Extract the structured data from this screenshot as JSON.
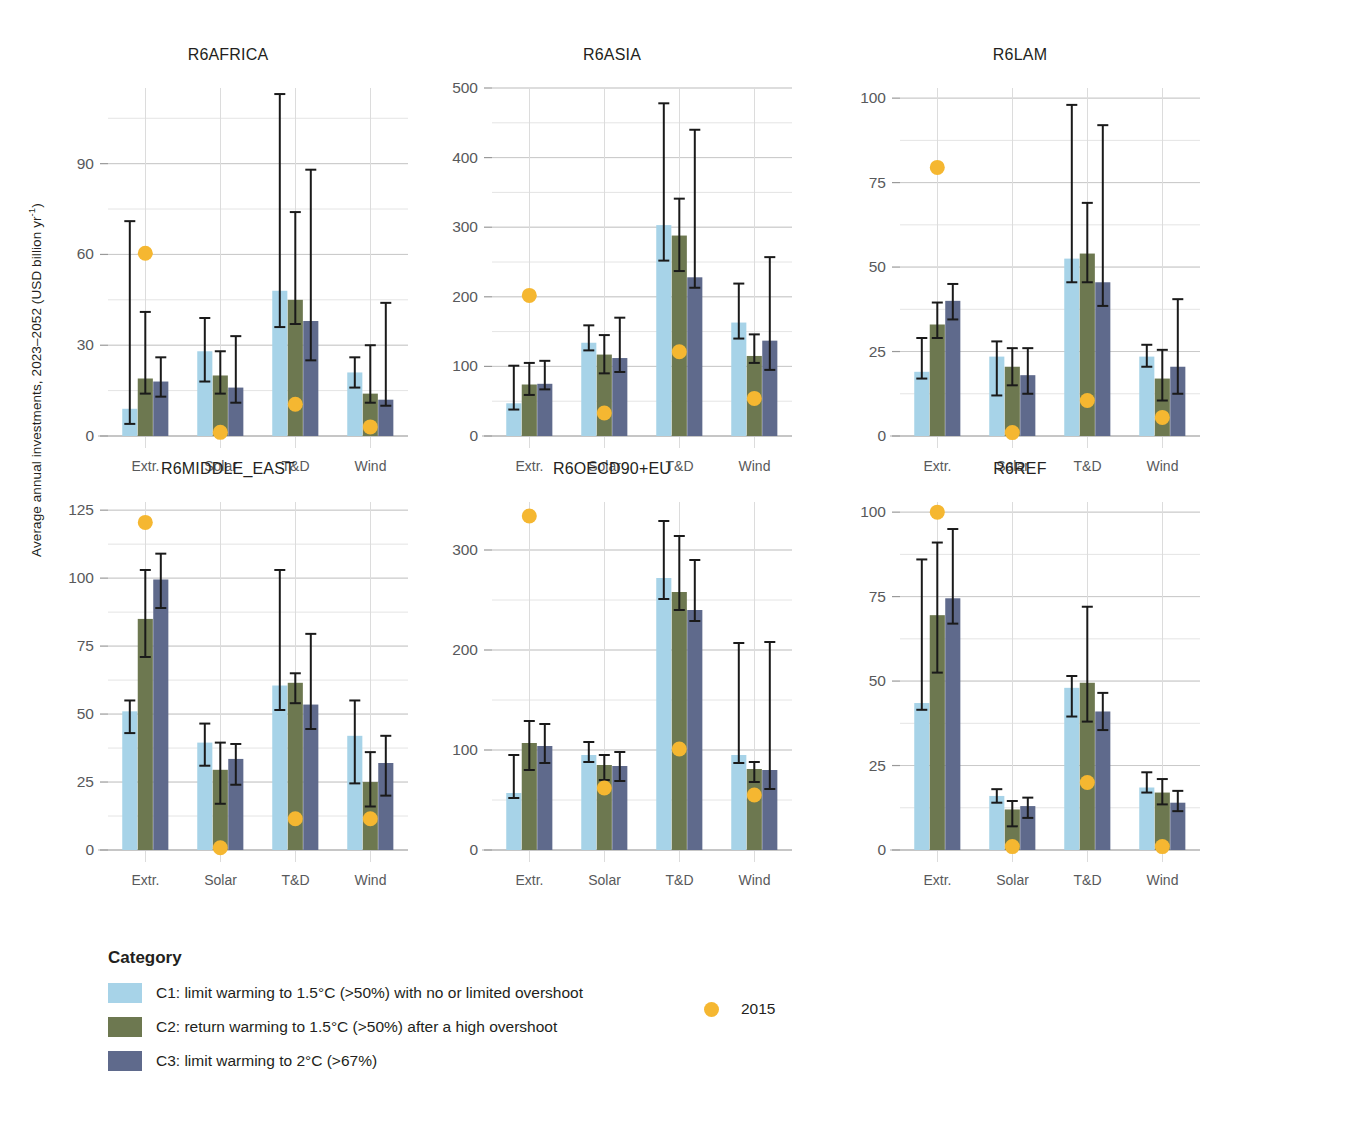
{
  "axis": {
    "ylabel": "Average annual investments, 2023–2052 (USD billion yr",
    "ylabel_sup": "-1",
    "ylabel_close": ")"
  },
  "legend": {
    "title": "Category",
    "items": [
      {
        "label": "C1: limit warming to 1.5°C (>50%) with no or limited overshoot",
        "color": "#a7d3e8"
      },
      {
        "label": "C2: return warming to 1.5°C (>50%) after a high overshoot",
        "color": "#6d7850"
      },
      {
        "label": "C3: limit warming to 2°C (>67%)",
        "color": "#5f6a8c"
      }
    ],
    "marker": {
      "label": "2015",
      "color": "#f5b731"
    }
  },
  "chart_data": {
    "type": "bar",
    "title": "",
    "xlabel": "",
    "ylabel": "Average annual investments, 2023–2052 (USD billion yr-1)",
    "grid": true,
    "legend_position": "bottom",
    "categories": [
      "Extr.",
      "Solar",
      "T&D",
      "Wind"
    ],
    "series_names": [
      "C1: limit warming to 1.5°C (>50%) with no or limited overshoot",
      "C2: return warming to 1.5°C (>50%) after a high overshoot",
      "C3: limit warming to 2°C (>67%)"
    ],
    "marker_series": "2015",
    "panels": [
      {
        "name": "R6AFRICA",
        "ylim": [
          0,
          115
        ],
        "yticks": [
          0,
          30,
          60,
          90
        ],
        "minor_step": 15,
        "series": [
          {
            "name": "C1",
            "values": [
              9,
              28,
              48,
              21
            ],
            "lo": [
              4,
              18,
              36,
              16
            ],
            "hi": [
              71,
              39,
              113,
              26
            ]
          },
          {
            "name": "C2",
            "values": [
              19,
              20,
              45,
              14
            ],
            "lo": [
              14,
              14,
              37,
              11
            ],
            "hi": [
              41,
              28,
              74,
              30
            ]
          },
          {
            "name": "C3",
            "values": [
              18,
              16,
              38,
              12
            ],
            "lo": [
              13,
              11,
              25,
              10
            ],
            "hi": [
              26,
              33,
              88,
              44
            ]
          }
        ],
        "marker_2015": [
          60.4,
          1.2,
          10.5,
          3.0
        ]
      },
      {
        "name": "R6ASIA",
        "ylim": [
          0,
          500
        ],
        "yticks": [
          0,
          100,
          200,
          300,
          400,
          500
        ],
        "minor_step": 50,
        "series": [
          {
            "name": "C1",
            "values": [
              47,
              134,
              303,
              163
            ],
            "lo": [
              38,
              123,
              252,
              140
            ],
            "hi": [
              101,
              159,
              478,
              219
            ]
          },
          {
            "name": "C2",
            "values": [
              74,
              117,
              288,
              115
            ],
            "lo": [
              59,
              90,
              237,
              105
            ],
            "hi": [
              105,
              145,
              341,
              146
            ]
          },
          {
            "name": "C3",
            "values": [
              75,
              112,
              228,
              137
            ],
            "lo": [
              67,
              92,
              213,
              95
            ],
            "hi": [
              108,
              170,
              440,
              257
            ]
          }
        ],
        "marker_2015": [
          202,
          33,
          121,
          54
        ]
      },
      {
        "name": "R6LAM",
        "ylim": [
          0,
          103
        ],
        "yticks": [
          0,
          25,
          50,
          75,
          100
        ],
        "minor_step": 12.5,
        "series": [
          {
            "name": "C1",
            "values": [
              19,
              23.5,
              52.5,
              23.5
            ],
            "lo": [
              17,
              12,
              45.5,
              20.5
            ],
            "hi": [
              29,
              28,
              98,
              27
            ]
          },
          {
            "name": "C2",
            "values": [
              33,
              20.5,
              54,
              17
            ],
            "lo": [
              29,
              15,
              45.5,
              10.5
            ],
            "hi": [
              39.5,
              26,
              69,
              25.5
            ]
          },
          {
            "name": "C3",
            "values": [
              40,
              18,
              45.5,
              20.5
            ],
            "lo": [
              34.5,
              12.5,
              38.5,
              12.5
            ],
            "hi": [
              45,
              26,
              92,
              40.5
            ]
          }
        ],
        "marker_2015": [
          79.5,
          1.0,
          10.5,
          5.5
        ]
      },
      {
        "name": "R6MIDDLE_EAST",
        "ylim": [
          0,
          128
        ],
        "yticks": [
          0,
          25,
          50,
          75,
          100,
          125
        ],
        "minor_step": 12.5,
        "series": [
          {
            "name": "C1",
            "values": [
              51,
              39.5,
              60.5,
              42
            ],
            "lo": [
              43,
              31,
              51.5,
              24.5
            ],
            "hi": [
              55,
              46.5,
              103,
              55
            ]
          },
          {
            "name": "C2",
            "values": [
              85,
              29.5,
              61.5,
              25
            ],
            "lo": [
              71,
              17,
              54,
              16
            ],
            "hi": [
              103,
              39.5,
              65,
              36
            ]
          },
          {
            "name": "C3",
            "values": [
              99.5,
              33.5,
              53.5,
              32
            ],
            "lo": [
              89,
              24,
              44.5,
              20
            ],
            "hi": [
              109,
              39,
              79.5,
              42
            ]
          }
        ],
        "marker_2015": [
          120.5,
          0.8,
          11.5,
          11.5
        ]
      },
      {
        "name": "R6OECD90+EU",
        "ylim": [
          0,
          348
        ],
        "yticks": [
          0,
          100,
          200,
          300
        ],
        "minor_step": 50,
        "series": [
          {
            "name": "C1",
            "values": [
              57,
              95,
              272,
              95
            ],
            "lo": [
              52,
              88,
              251,
              87
            ],
            "hi": [
              95,
              108,
              329,
              207
            ]
          },
          {
            "name": "C2",
            "values": [
              107,
              85,
              258,
              81
            ],
            "lo": [
              80,
              70,
              240,
              68
            ],
            "hi": [
              129,
              95,
              314,
              88
            ]
          },
          {
            "name": "C3",
            "values": [
              104,
              84,
              240,
              80
            ],
            "lo": [
              87,
              69,
              229,
              61
            ],
            "hi": [
              126,
              98,
              290,
              208
            ]
          }
        ],
        "marker_2015": [
          334,
          62,
          101,
          55
        ]
      },
      {
        "name": "R6REF",
        "ylim": [
          0,
          103
        ],
        "yticks": [
          0,
          25,
          50,
          75,
          100
        ],
        "minor_step": 12.5,
        "series": [
          {
            "name": "C1",
            "values": [
              43.5,
              16,
              48,
              18.5
            ],
            "lo": [
              41.5,
              14,
              39.5,
              17
            ],
            "hi": [
              86,
              18,
              51.5,
              23
            ]
          },
          {
            "name": "C2",
            "values": [
              69.5,
              12,
              49.5,
              17
            ],
            "lo": [
              52.5,
              7,
              38,
              13.5
            ],
            "hi": [
              91,
              14.5,
              72,
              21
            ]
          },
          {
            "name": "C3",
            "values": [
              74.5,
              13,
              41,
              14
            ],
            "lo": [
              67,
              9.5,
              35.5,
              11.5
            ],
            "hi": [
              95,
              15.5,
              46.5,
              17.5
            ]
          }
        ],
        "marker_2015": [
          100,
          1.0,
          20,
          1.0
        ]
      }
    ]
  }
}
